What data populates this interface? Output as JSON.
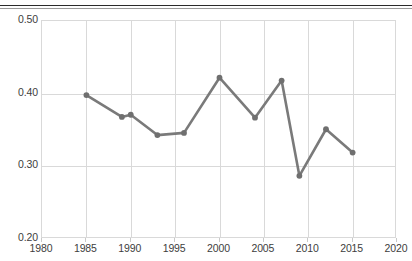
{
  "figure": {
    "name": "line-chart-figure",
    "top_rule": "document-rule",
    "background_color": "#ffffff"
  },
  "chart_data": {
    "type": "line",
    "title": "",
    "subtitle": "",
    "xlabel": "",
    "ylabel": "",
    "xlim": [
      1980,
      2020
    ],
    "ylim": [
      0.2,
      0.5
    ],
    "grid": true,
    "legend": null,
    "legend_position": "none",
    "line_color": "#7a7a7a",
    "marker": "circle",
    "marker_color": "#6f6f6f",
    "x_ticks": [
      1980,
      1985,
      1990,
      1995,
      2000,
      2005,
      2010,
      2015,
      2020
    ],
    "x_tick_labels": [
      "1980",
      "1985",
      "1990",
      "1995",
      "2000",
      "2005",
      "2010",
      "2015",
      "2020"
    ],
    "y_ticks": [
      0.2,
      0.3,
      0.4,
      0.5
    ],
    "y_tick_labels": [
      "0.20",
      "0.30",
      "0.40",
      "0.50"
    ],
    "x": [
      1985,
      1989,
      1990,
      1993,
      1996,
      2000,
      2004,
      2007,
      2009,
      2012,
      2015
    ],
    "values": [
      0.398,
      0.368,
      0.371,
      0.343,
      0.346,
      0.422,
      0.367,
      0.418,
      0.287,
      0.351,
      0.319
    ],
    "series": [
      {
        "name": "series-1",
        "x": [
          1985,
          1989,
          1990,
          1993,
          1996,
          2000,
          2004,
          2007,
          2009,
          2012,
          2015
        ],
        "values": [
          0.398,
          0.368,
          0.371,
          0.343,
          0.346,
          0.422,
          0.367,
          0.418,
          0.287,
          0.351,
          0.319
        ]
      }
    ]
  }
}
